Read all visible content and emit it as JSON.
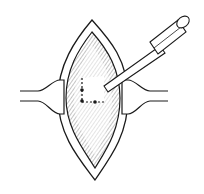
{
  "illustration": {
    "subject": "surgical incision with retractors and instrument",
    "colors": {
      "line": "#1a1a1a",
      "background": "#ffffff",
      "shading": "#555555"
    }
  }
}
